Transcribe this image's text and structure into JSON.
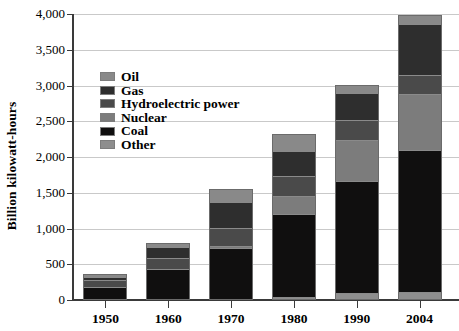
{
  "chart_data": {
    "type": "bar",
    "subtype": "stacked-bar",
    "title": "",
    "xlabel": "",
    "ylabel": "Billion kilowatt-hours",
    "categories": [
      "1950",
      "1960",
      "1970",
      "1980",
      "1990",
      "2004"
    ],
    "ylim": [
      0,
      4000
    ],
    "ytick_values": [
      0,
      500,
      1000,
      1500,
      2000,
      2500,
      3000,
      3500,
      4000
    ],
    "ytick_labels": [
      "0",
      "500",
      "1,000",
      "1,500",
      "2,000",
      "2,500",
      "3,000",
      "3,500",
      "4,000"
    ],
    "grid": true,
    "legend_position": "inside-upper-left",
    "stack_order_bottom_to_top": [
      "Other",
      "Coal",
      "Nuclear",
      "Hydroelectric power",
      "Gas",
      "Oil"
    ],
    "series": [
      {
        "name": "Other",
        "color": "#8e8e8e",
        "values": [
          0,
          0,
          0,
          10,
          70,
          90
        ]
      },
      {
        "name": "Coal",
        "color": "#100f0f",
        "values": [
          155,
          405,
          705,
          1160,
          1560,
          1975
        ]
      },
      {
        "name": "Nuclear",
        "color": "#7c7c7c",
        "values": [
          0,
          0,
          22,
          250,
          575,
          790
        ]
      },
      {
        "name": "Hydroelectric power",
        "color": "#4a4a4a",
        "values": [
          100,
          150,
          250,
          280,
          290,
          270
        ]
      },
      {
        "name": "Gas",
        "color": "#2e2e2e",
        "values": [
          45,
          160,
          370,
          350,
          370,
          710
        ]
      },
      {
        "name": "Oil",
        "color": "#898989",
        "values": [
          35,
          55,
          180,
          250,
          120,
          120
        ]
      }
    ],
    "totals": [
      335,
      770,
      1527,
      2300,
      2985,
      3955
    ],
    "legend_entries": [
      {
        "label": "Oil",
        "color": "#898989"
      },
      {
        "label": "Gas",
        "color": "#2e2e2e"
      },
      {
        "label": "Hydroelectric power",
        "color": "#4a4a4a"
      },
      {
        "label": "Nuclear",
        "color": "#7c7c7c"
      },
      {
        "label": "Coal",
        "color": "#100f0f"
      },
      {
        "label": "Other",
        "color": "#8e8e8e"
      }
    ]
  },
  "axis": {
    "y_title": "Billion kilowatt-hours"
  }
}
